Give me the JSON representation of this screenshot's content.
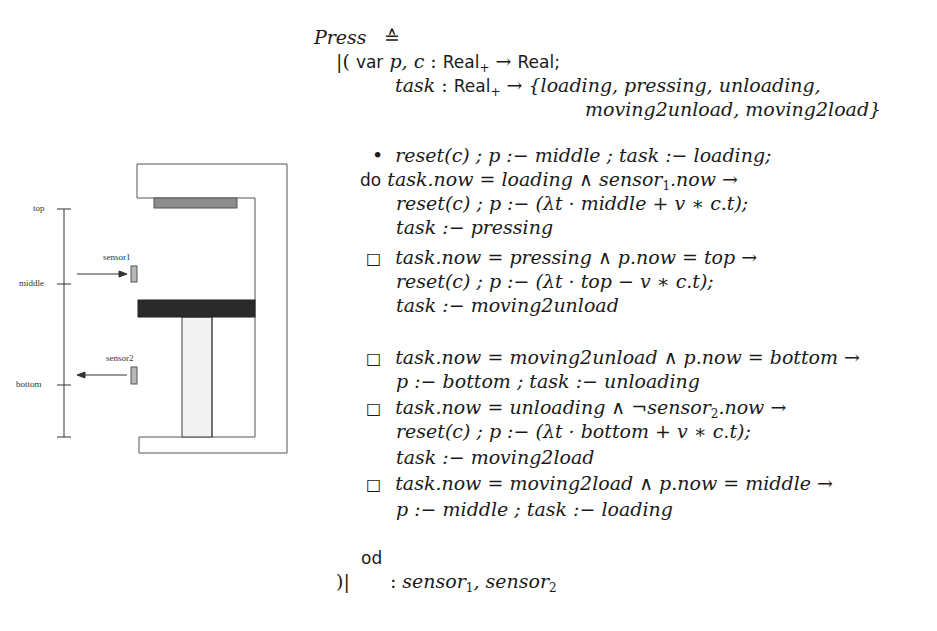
{
  "diagram": {
    "labels": {
      "top": "top",
      "middle": "middle",
      "bottom": "bottom",
      "sensor1": "sensor1",
      "sensor2": "sensor2"
    },
    "colors": {
      "frame_stroke": "#555555",
      "top_plate": "#8c8c8c",
      "press_bar": "#2a2a2a",
      "piston_fill": "#f2f2f2",
      "sensor_fill": "#b8b8b8"
    }
  },
  "spec": {
    "title": "Press",
    "def_symbol": "≙",
    "open_bracket": "|(",
    "close_bracket": ")|",
    "var_keyword": "var",
    "do_keyword": "do",
    "od_keyword": "od",
    "bullet": "•",
    "choice": "□",
    "lines": {
      "decl1_vars": "p, c",
      "decl1_type_domain": "Real",
      "decl1_type_sub": "+",
      "decl1_arrow": "→",
      "decl1_type_range": "Real;",
      "decl2_var": "task",
      "decl2_enum_1": "{loading, pressing, unloading,",
      "decl2_enum_2": "moving2unload, moving2load}",
      "init": "reset(c) ; p :− middle ; task :− loading;",
      "g1_guard_a": "task.now = loading ∧ sensor",
      "g1_guard_sub": "1",
      "g1_guard_b": ".now →",
      "g1_action1": "reset(c) ; p :− (λt · middle + v ∗ c.t);",
      "g1_action2": "task :− pressing",
      "g2_guard": "task.now = pressing ∧ p.now = top →",
      "g2_action1": "reset(c) ; p :− (λt · top − v ∗ c.t);",
      "g2_action2": "task :− moving2unload",
      "g3_guard": "task.now = moving2unload ∧ p.now = bottom →",
      "g3_action1": "p :− bottom ; task :− unloading",
      "g4_guard_a": "task.now = unloading ∧ ¬sensor",
      "g4_guard_sub": "2",
      "g4_guard_b": ".now →",
      "g4_action1": "reset(c) ; p :− (λt · bottom + v ∗ c.t);",
      "g4_action2": "task :− moving2load",
      "g5_guard": "task.now = moving2load ∧ p.now = middle →",
      "g5_action1": "p :− middle ; task :− loading",
      "interface_colon": ":",
      "interface_s1": "sensor",
      "interface_s1_sub": "1",
      "interface_sep": ", ",
      "interface_s2": "sensor",
      "interface_s2_sub": "2"
    }
  }
}
